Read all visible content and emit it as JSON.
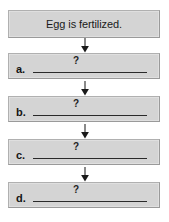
{
  "diagram": {
    "type": "vertical-flowchart",
    "title": "",
    "orientation": "top-to-bottom",
    "connector": "down-arrow",
    "nodes": [
      {
        "id": "start",
        "kind": "statement",
        "label": "",
        "text": "Egg is fertilized.",
        "filled": true
      },
      {
        "id": "step-a",
        "kind": "blank",
        "label": "a.",
        "text": "?",
        "filled": false
      },
      {
        "id": "step-b",
        "kind": "blank",
        "label": "b.",
        "text": "?",
        "filled": false
      },
      {
        "id": "step-c",
        "kind": "blank",
        "label": "c.",
        "text": "?",
        "filled": false
      },
      {
        "id": "step-d",
        "kind": "blank",
        "label": "d.",
        "text": "?",
        "filled": false
      }
    ],
    "arrows": [
      {
        "id": "arrow-1",
        "from": "start",
        "to": "step-a",
        "glyph": "down-arrow-icon"
      },
      {
        "id": "arrow-2",
        "from": "step-a",
        "to": "step-b",
        "glyph": "down-arrow-icon"
      },
      {
        "id": "arrow-3",
        "from": "step-b",
        "to": "step-c",
        "glyph": "down-arrow-icon"
      },
      {
        "id": "arrow-4",
        "from": "step-c",
        "to": "step-d",
        "glyph": "down-arrow-icon"
      }
    ],
    "colors": {
      "box_fill": "#d4d4d4",
      "box_border": "#b0b0b0",
      "text": "#1a1a1a",
      "line": "#2a2a2a",
      "background": "#ffffff"
    }
  }
}
